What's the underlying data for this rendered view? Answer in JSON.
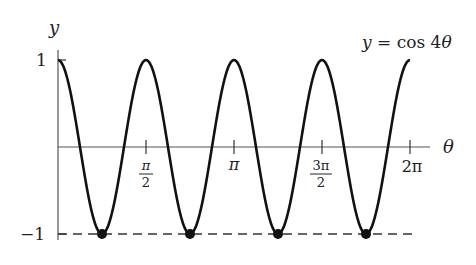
{
  "chart_data": {
    "type": "line",
    "title": "y = cos 4θ",
    "function": "y = cos(4θ)",
    "xlabel": "θ",
    "ylabel": "y",
    "xlim": [
      0,
      6.2832
    ],
    "ylim": [
      -1,
      1
    ],
    "x_ticks": [
      {
        "value": 1.5708,
        "label": "π/2"
      },
      {
        "value": 3.1416,
        "label": "π"
      },
      {
        "value": 4.7124,
        "label": "3π/2"
      },
      {
        "value": 6.2832,
        "label": "2π"
      }
    ],
    "y_ticks": [
      {
        "value": 1,
        "label": "1"
      },
      {
        "value": -1,
        "label": "−1"
      }
    ],
    "reference_lines": [
      {
        "y": -1,
        "style": "dashed"
      }
    ],
    "marked_points": [
      {
        "x": 0.7854,
        "y": -1,
        "label": "π/4"
      },
      {
        "x": 2.3562,
        "y": -1,
        "label": "3π/4"
      },
      {
        "x": 3.927,
        "y": -1,
        "label": "5π/4"
      },
      {
        "x": 5.4978,
        "y": -1,
        "label": "7π/4"
      }
    ],
    "grid": false,
    "color": "#111111"
  },
  "labels": {
    "equation_lhs": "y = cos 4",
    "equation_var": "θ",
    "y_axis": "y",
    "x_axis": "θ",
    "tick_one": "1",
    "tick_neg_one": "−1",
    "tick_pi_over_2_num": "π",
    "tick_pi_over_2_den": "2",
    "tick_pi": "π",
    "tick_3pi_over_2_num": "3π",
    "tick_3pi_over_2_den": "2",
    "tick_2pi": "2π"
  }
}
